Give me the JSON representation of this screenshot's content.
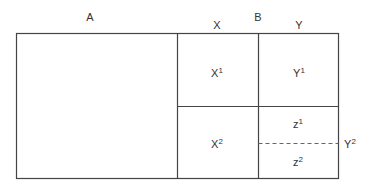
{
  "diagram": {
    "labels": {
      "A": "A",
      "B": "B",
      "X": "X",
      "Y": "Y",
      "X1": {
        "base": "X",
        "sup": "1"
      },
      "Y1": {
        "base": "Y",
        "sup": "1"
      },
      "X2": {
        "base": "X",
        "sup": "2"
      },
      "Z1": {
        "base": "z",
        "sup": "1"
      },
      "Z2": {
        "base": "z",
        "sup": "2"
      },
      "Y2": {
        "base": "Y",
        "sup": "2"
      }
    },
    "line_color": "#444444"
  }
}
